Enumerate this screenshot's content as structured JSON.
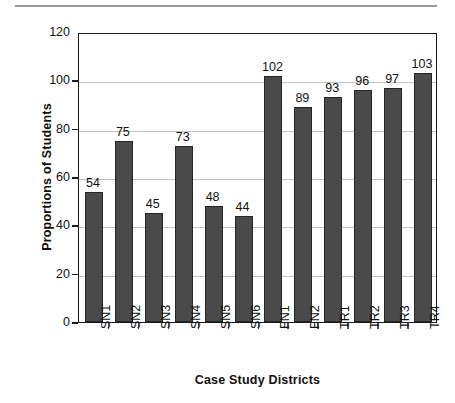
{
  "chart_data": {
    "type": "bar",
    "title": "",
    "xlabel": "Case Study Districts",
    "ylabel": "Proportions of Students",
    "categories": [
      "SN1",
      "SN2",
      "SN3",
      "SN4",
      "SN5",
      "SN6",
      "FN1",
      "FN2",
      "TR1",
      "TR2",
      "TR3",
      "TR4"
    ],
    "values": [
      54,
      75,
      45,
      73,
      48,
      44,
      102,
      89,
      93,
      96,
      97,
      103
    ],
    "value_labels": [
      "54",
      "75",
      "45",
      "73",
      "48",
      "44",
      "102",
      "89",
      "93",
      "96",
      "97",
      "103"
    ],
    "ylim": [
      0,
      120
    ],
    "ytick_labels": [
      "0",
      "20",
      "40",
      "60",
      "80",
      "100",
      "120"
    ],
    "ytick_values": [
      0,
      20,
      40,
      60,
      80,
      100,
      120
    ],
    "grid": "horizontal",
    "gridline_values": [
      20,
      40,
      60,
      80,
      100
    ],
    "legend": "none",
    "bar_color": "#4a4a4a",
    "bar_border_color": "#262626",
    "gridline_color": "#c2c2c2",
    "axis_color": "#1b1b1b",
    "text_color": "#111111",
    "rule_color": "#9a9a9a",
    "background": "#ffffff",
    "xtick_label_rotation": -90
  }
}
